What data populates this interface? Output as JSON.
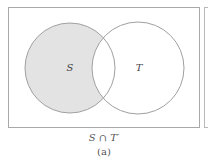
{
  "diagram": {
    "type": "venn",
    "sets": [
      {
        "name": "S",
        "label": "S",
        "cx": 70,
        "cy": 68,
        "r": 45,
        "shaded": true
      },
      {
        "name": "T",
        "label": "T",
        "cx": 138,
        "cy": 68,
        "r": 46,
        "shaded": false
      }
    ],
    "shaded_region": "S ∩ T′",
    "colors": {
      "shade": "#e3e3e3",
      "stroke": "#a0a0a0",
      "frame": "#a8a8a8"
    }
  },
  "caption": {
    "expression": "S ∩ T′",
    "label": "(a)"
  }
}
